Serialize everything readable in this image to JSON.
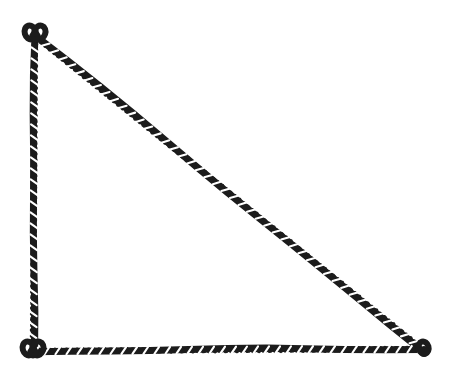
{
  "image": {
    "kind": "line-drawing",
    "subject": "rope-triangle",
    "title": "Right triangle formed from twisted rope",
    "description": "A closed right-angled triangle drawn as a single twisted rope or cord, with small knot loops tying the rope together at each of the three corners.",
    "background_color": "#ffffff",
    "width": 458,
    "height": 385
  },
  "rope": {
    "color": "#1c1c1c",
    "highlight_color": "#ffffff",
    "thickness": 7,
    "strand_thickness": 2.6,
    "texture": "twisted-strand",
    "twist_period": 11,
    "label": "twisted rope cord"
  },
  "geometry": {
    "shape": "right-triangle",
    "vertices": [
      {
        "name": "apex-top-left",
        "x": 35,
        "y": 36,
        "knot": "double-loop"
      },
      {
        "name": "right-angle-bottom-left",
        "x": 33,
        "y": 351,
        "knot": "loop"
      },
      {
        "name": "corner-bottom-right",
        "x": 422,
        "y": 349,
        "knot": "loop"
      }
    ],
    "edges": [
      {
        "name": "vertical-leg",
        "from": 0,
        "to": 1,
        "orientation": "vertical",
        "length_px": 315
      },
      {
        "name": "horizontal-leg",
        "from": 1,
        "to": 2,
        "orientation": "horizontal",
        "length_px": 389
      },
      {
        "name": "hypotenuse",
        "from": 0,
        "to": 2,
        "orientation": "diagonal",
        "length_px": 502
      }
    ],
    "right_angle_at": "right-angle-bottom-left"
  },
  "knots": [
    {
      "name": "knot-top-left",
      "cx": 35,
      "cy": 34,
      "r": 9,
      "loops": 2
    },
    {
      "name": "knot-bottom-left",
      "cx": 33,
      "cy": 350,
      "r": 9,
      "loops": 2
    },
    {
      "name": "knot-bottom-right",
      "cx": 424,
      "cy": 349,
      "r": 8,
      "loops": 1
    }
  ]
}
